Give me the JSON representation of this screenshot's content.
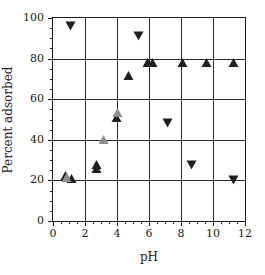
{
  "chart_data": {
    "type": "scatter",
    "title": "",
    "xlabel": "pH",
    "ylabel": "Percent adsorbed",
    "xlim": [
      0,
      12
    ],
    "ylim": [
      0,
      100
    ],
    "xticks": [
      0,
      2,
      4,
      6,
      8,
      10,
      12
    ],
    "yticks": [
      0,
      20,
      40,
      60,
      80,
      100
    ],
    "xtick_labels": [
      "0",
      "2",
      "4",
      "6",
      "8",
      "10",
      "12"
    ],
    "ytick_labels": [
      "0",
      "20",
      "40",
      "60",
      "80",
      "100"
    ],
    "grid": true,
    "legend": "none",
    "series": [
      {
        "name": "filled-up-triangle",
        "marker": "triangle-up",
        "fill": "solid",
        "color": "#1f1f1f",
        "points": [
          {
            "x": 0.8,
            "y": 22.0
          },
          {
            "x": 1.2,
            "y": 20.5
          },
          {
            "x": 2.72,
            "y": 27.5
          },
          {
            "x": 2.78,
            "y": 25.5
          },
          {
            "x": 4.0,
            "y": 50.5
          },
          {
            "x": 4.75,
            "y": 71.5
          },
          {
            "x": 5.95,
            "y": 78.0
          },
          {
            "x": 6.25,
            "y": 78.0
          },
          {
            "x": 8.1,
            "y": 78.0
          },
          {
            "x": 9.6,
            "y": 78.0
          },
          {
            "x": 11.3,
            "y": 78.0
          }
        ]
      },
      {
        "name": "open-up-triangle",
        "marker": "triangle-up",
        "fill": "open",
        "color": "#8e8e8e",
        "points": [
          {
            "x": 0.85,
            "y": 21.0
          },
          {
            "x": 3.2,
            "y": 40.0
          },
          {
            "x": 4.05,
            "y": 53.0
          }
        ]
      },
      {
        "name": "filled-down-triangle",
        "marker": "triangle-down",
        "fill": "solid",
        "color": "#1f1f1f",
        "points": [
          {
            "x": 1.1,
            "y": 96.0
          },
          {
            "x": 5.4,
            "y": 91.0
          },
          {
            "x": 7.2,
            "y": 48.5
          },
          {
            "x": 8.7,
            "y": 27.5
          },
          {
            "x": 11.3,
            "y": 20.0
          }
        ]
      }
    ]
  }
}
